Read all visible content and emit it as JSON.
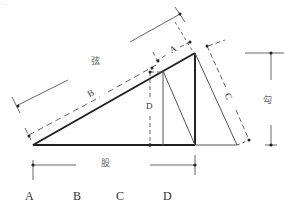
{
  "figure": {
    "corner_mark": "...",
    "labels": {
      "hypotenuse": "弦",
      "short_leg": "勾",
      "long_leg": "股",
      "segment_a": "A",
      "segment_b": "B",
      "segment_c": "C",
      "segment_d": "D"
    },
    "bottom_labels": [
      "A",
      "B",
      "C",
      "D"
    ],
    "colors": {
      "thick_line": "#222222",
      "thin_line": "#555555",
      "dim_line": "#666666",
      "background": "#ffffff"
    }
  }
}
